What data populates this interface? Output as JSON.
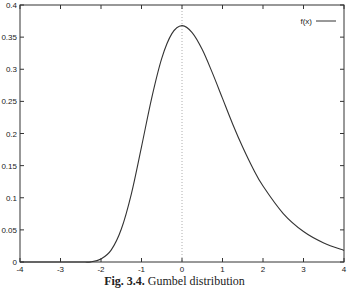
{
  "chart_data": {
    "type": "line",
    "title": "",
    "xlabel": "",
    "ylabel": "",
    "xlim": [
      -4,
      4
    ],
    "ylim": [
      0,
      0.4
    ],
    "grid": false,
    "legend_position": "top-right",
    "x_ticks": [
      "-4",
      "-3",
      "-2",
      "-1",
      "0",
      "1",
      "2",
      "3",
      "4"
    ],
    "y_ticks": [
      "0",
      "0.05",
      "0.1",
      "0.15",
      "0.2",
      "0.25",
      "0.3",
      "0.35",
      "0.4"
    ],
    "series": [
      {
        "name": "f(x)",
        "color": "#333333",
        "x": [
          -4,
          -3,
          -2.5,
          -2.25,
          -2,
          -1.75,
          -1.5,
          -1.25,
          -1,
          -0.75,
          -0.5,
          -0.25,
          0,
          0.25,
          0.5,
          0.75,
          1,
          1.25,
          1.5,
          1.75,
          2,
          2.5,
          3,
          3.5,
          4
        ],
        "values": [
          0.0,
          0.0,
          0.0,
          0.0002,
          0.0046,
          0.0184,
          0.0509,
          0.1062,
          0.1793,
          0.2548,
          0.317,
          0.3554,
          0.3679,
          0.3571,
          0.3307,
          0.2943,
          0.2546,
          0.2149,
          0.1785,
          0.146,
          0.1182,
          0.0754,
          0.0474,
          0.0296,
          0.018
        ]
      }
    ],
    "annotations": [
      {
        "type": "vertical-dotted-line",
        "x": 0
      }
    ]
  },
  "caption": {
    "fig_label": "Fig. 3.4.",
    "text": "Gumbel distribution"
  }
}
